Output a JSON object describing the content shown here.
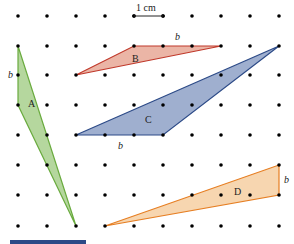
{
  "scale_bar": {
    "label": "1 cm"
  },
  "grid": {
    "xs": [
      18,
      47,
      76,
      105,
      134,
      163,
      192,
      221,
      250,
      279
    ],
    "ys": [
      16,
      46,
      75,
      105,
      135,
      165,
      195,
      226
    ]
  },
  "shapes": [
    {
      "name": "A",
      "label": "A",
      "fill": "#a8d08d",
      "stroke": "#6aab3f",
      "points": "18,46 18,105 76,226",
      "label_pos": [
        28,
        107
      ],
      "base_label": "b",
      "base_pos": [
        8,
        78
      ]
    },
    {
      "name": "B",
      "label": "B",
      "fill": "#e8a896",
      "stroke": "#c0392b",
      "points": "76,75 134,46 221,46",
      "label_pos": [
        132,
        62
      ],
      "base_label": "b",
      "base_pos": [
        175,
        40
      ]
    },
    {
      "name": "C",
      "label": "C",
      "fill": "#8ea1c7",
      "stroke": "#2c4a87",
      "points": "76,135 279,46 163,135",
      "label_pos": [
        145,
        123
      ],
      "base_label": "b",
      "base_pos": [
        118,
        149
      ]
    },
    {
      "name": "D",
      "label": "D",
      "fill": "#f6cfa2",
      "stroke": "#e67e22",
      "points": "105,226 279,165 279,195",
      "label_pos": [
        234,
        195
      ],
      "base_label": "b",
      "base_pos": [
        284,
        183
      ]
    }
  ],
  "bottom_bar": {
    "color": "#2c4a87"
  }
}
